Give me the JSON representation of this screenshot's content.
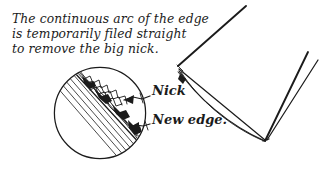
{
  "figure": {
    "background_color": "#ffffff",
    "ink_color": "#1b1b1b"
  },
  "note": {
    "lines": [
      "The continuous arc of the edge",
      "is temporarily filed straight",
      "to remove the big nick."
    ],
    "line1": "The continuous arc of the edge",
    "line2": "is temporarily filed straight",
    "line3": "to remove the big nick."
  },
  "callouts": [
    {
      "label": "Nick",
      "target": "nick-in-edge"
    },
    {
      "label": "New edge.",
      "target": "filed-straight-edge"
    }
  ],
  "callout_nick": "Nick",
  "callout_new_edge": "New edge.",
  "detail_circle": {
    "name": "magnified-edge-detail",
    "center_x": 100,
    "center_y": 113,
    "radius": 46,
    "contents": "hatched bevel with jagged nick and newly filed straight edge"
  },
  "blade": {
    "name": "knife-blade-tip",
    "tip_x": 178,
    "tip_y": 66,
    "heel_x": 265,
    "heel_y": 140,
    "nick_marker": "dark notch just below the tip on the cutting edge"
  }
}
